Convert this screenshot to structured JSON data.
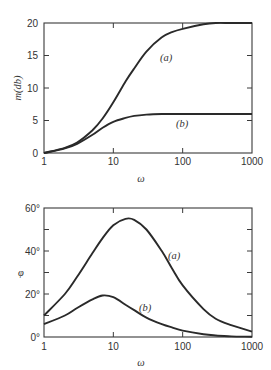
{
  "chart_data": [
    {
      "type": "line",
      "title": "",
      "xlabel": "ω",
      "ylabel": "m(db)",
      "xscale": "log",
      "xlim": [
        1,
        1000
      ],
      "ylim": [
        0,
        20
      ],
      "x_ticks": [
        "1",
        "10",
        "100",
        "1000"
      ],
      "y_ticks": [
        "0",
        "5",
        "10",
        "15",
        "20"
      ],
      "grid": false,
      "x": [
        1,
        2,
        3,
        5,
        7,
        10,
        15,
        20,
        30,
        50,
        70,
        100,
        200,
        300,
        500,
        1000
      ],
      "series": [
        {
          "name": "(a)",
          "values": [
            0,
            0.8,
            1.6,
            3.5,
            5.3,
            7.8,
            11.0,
            13.0,
            15.6,
            17.8,
            18.6,
            19.1,
            19.8,
            20.0,
            20.0,
            20.0
          ]
        },
        {
          "name": "(b)",
          "values": [
            0,
            0.7,
            1.4,
            2.8,
            3.9,
            4.8,
            5.4,
            5.7,
            5.9,
            6.0,
            6.0,
            6.0,
            6.0,
            6.0,
            6.0,
            6.0
          ]
        }
      ],
      "annotations": [
        {
          "text": "(a)",
          "x": 22,
          "y": 14.5
        },
        {
          "text": "(b)",
          "x": 70,
          "y": 4.5
        }
      ]
    },
    {
      "type": "line",
      "title": "",
      "xlabel": "ω",
      "ylabel": "φ",
      "xscale": "log",
      "xlim": [
        1,
        1000
      ],
      "ylim": [
        0,
        60
      ],
      "x_ticks": [
        "1",
        "10",
        "100",
        "1000"
      ],
      "y_ticks": [
        "0°",
        "20°",
        "40°",
        "60°"
      ],
      "grid": false,
      "x": [
        1,
        2,
        3,
        5,
        7,
        10,
        15,
        20,
        30,
        50,
        70,
        100,
        200,
        300,
        500,
        1000
      ],
      "series": [
        {
          "name": "(a)",
          "values": [
            10,
            20,
            28,
            39,
            46,
            52,
            55,
            54.5,
            50,
            40,
            32,
            24,
            13,
            8.5,
            5.5,
            2.5
          ]
        },
        {
          "name": "(b)",
          "values": [
            6,
            10,
            13.5,
            17.5,
            19.3,
            18.5,
            15,
            12.5,
            9,
            6,
            4.5,
            3,
            1.3,
            0.7,
            0.3,
            0.1
          ]
        }
      ],
      "annotations": [
        {
          "text": "(a)",
          "x": 65,
          "y": 38
        },
        {
          "text": "(b)",
          "x": 35,
          "y": 13
        }
      ]
    }
  ],
  "plots": [
    {
      "ylabel": "m(db)",
      "xlabel": "ω",
      "label_a": "(a)",
      "label_b": "(b)",
      "yticks": [
        "0",
        "5",
        "10",
        "15",
        "20"
      ],
      "xticks": [
        "1",
        "10",
        "100",
        "1000"
      ]
    },
    {
      "ylabel": "φ",
      "xlabel": "ω",
      "label_a": "(a)",
      "label_b": "(b)",
      "yticks": [
        "0°",
        "20°",
        "40°",
        "60°"
      ],
      "xticks": [
        "1",
        "10",
        "100",
        "1000"
      ]
    }
  ]
}
